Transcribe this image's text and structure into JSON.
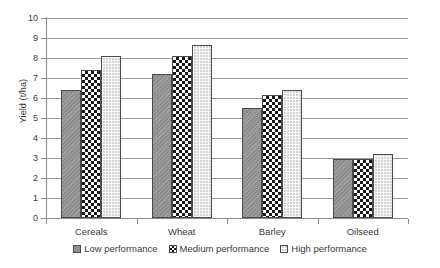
{
  "chart_data": {
    "type": "bar",
    "title": "",
    "xlabel": "",
    "ylabel": "Yield (t/ha)",
    "ylim": [
      0,
      10
    ],
    "ytick_step": 1,
    "yticks": [
      "10",
      "9",
      "8",
      "7",
      "6",
      "5",
      "4",
      "3",
      "2",
      "1",
      "0"
    ],
    "grid": true,
    "legend_position": "bottom",
    "categories": [
      "Cereals",
      "Wheat",
      "Barley",
      "Oilseed"
    ],
    "series": [
      {
        "name": "Low performance",
        "pattern": "solid-gray",
        "color": "#8e8e8e",
        "values": [
          6.4,
          7.2,
          5.5,
          2.95
        ]
      },
      {
        "name": "Medium performance",
        "pattern": "checkerboard",
        "color": "#1a1a1a",
        "values": [
          7.4,
          8.1,
          6.15,
          2.95
        ]
      },
      {
        "name": "High performance",
        "pattern": "light-grid",
        "color": "#d3d3d3",
        "values": [
          8.1,
          8.65,
          6.4,
          3.2
        ]
      }
    ]
  },
  "axis": {
    "y_title": "Yield (t/ha)"
  }
}
